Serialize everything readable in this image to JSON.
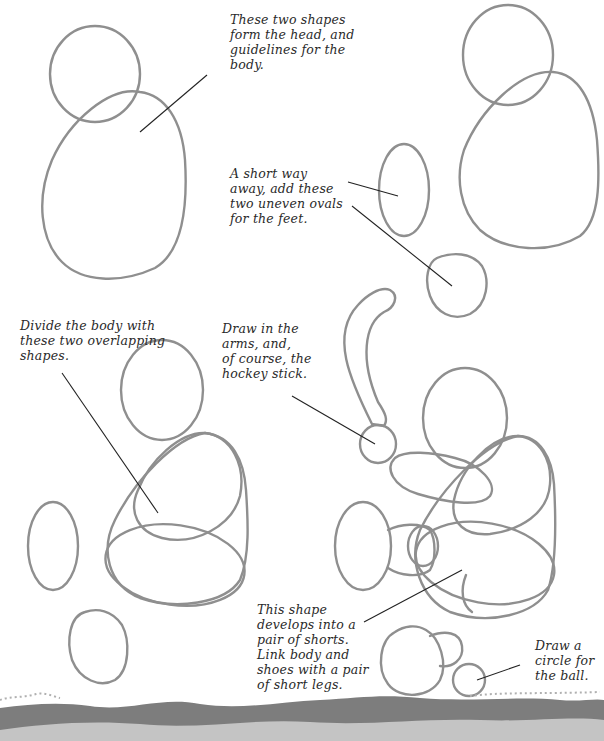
{
  "steps": [
    {
      "id": "step-1",
      "note": "These two shapes\nform the head, and\nguidelines for the\nbody."
    },
    {
      "id": "step-2",
      "note": "A short way\naway, add these\ntwo uneven ovals\nfor the feet."
    },
    {
      "id": "step-3",
      "note": "Divide the body with\nthese two overlapping\nshapes."
    },
    {
      "id": "step-4a",
      "note": "Draw in the\narms, and,\nof course, the\nhockey stick."
    },
    {
      "id": "step-4b",
      "note": "This shape\ndevelops into a\npair of shorts.\nLink body and\nshoes with a pair\nof short legs."
    },
    {
      "id": "step-4c",
      "note": "Draw a\ncircle for\nthe ball."
    }
  ],
  "colors": {
    "sketch_line": "#8f8f8f",
    "leader_line": "#222222",
    "text": "#2a2a2a",
    "band_dark": "#7d7d7d",
    "band_light": "#c4c4c4"
  }
}
